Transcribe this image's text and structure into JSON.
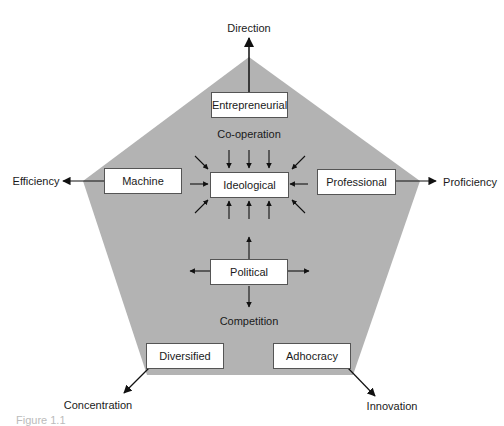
{
  "diagram": {
    "pentagon_fill": "#b3b3b3",
    "axes": {
      "top": "Direction",
      "left": "Efficiency",
      "right": "Proficiency",
      "bottom_left": "Concentration",
      "bottom_right": "Innovation"
    },
    "boxes": {
      "entrepreneurial": "Entrepreneurial",
      "machine": "Machine",
      "ideological": "Ideological",
      "professional": "Professional",
      "political": "Political",
      "diversified": "Diversified",
      "adhocracy": "Adhocracy"
    },
    "forces": {
      "cooperation": "Co-operation",
      "competition": "Competition"
    },
    "caption": "Figure 1.1"
  }
}
